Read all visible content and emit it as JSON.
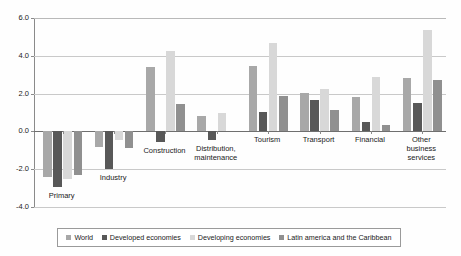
{
  "chart_data": {
    "type": "bar",
    "title": "",
    "subtitle": "",
    "xlabel": "",
    "ylabel": "",
    "ylim": [
      -4.0,
      6.0
    ],
    "yticks": [
      "6.0",
      "4.0",
      "2.0",
      "0.0",
      "-2.0",
      "-4.0"
    ],
    "ytick_values": [
      6.0,
      4.0,
      2.0,
      0.0,
      -2.0,
      -4.0
    ],
    "grid": true,
    "legend_position": "bottom",
    "orientation": "vertical",
    "grouping": "clustered",
    "categories": [
      "Primary",
      "Industry",
      "Construction",
      "Distribution,\nmaintenance",
      "Tourism",
      "Transport",
      "Financial",
      "Other\nbusiness\nservices"
    ],
    "series": [
      {
        "name": "World",
        "color": "#a8a8a8",
        "values": [
          -2.4,
          -0.8,
          3.4,
          0.8,
          3.45,
          2.05,
          1.8,
          2.85
        ]
      },
      {
        "name": "Developed economies",
        "color": "#585858",
        "values": [
          -2.95,
          -2.0,
          -0.55,
          -0.45,
          1.05,
          1.65,
          0.5,
          1.5
        ]
      },
      {
        "name": "Developing economies",
        "color": "#d8d8d8",
        "values": [
          -2.5,
          -0.45,
          4.25,
          1.0,
          4.7,
          2.25,
          2.9,
          5.35
        ]
      },
      {
        "name": "Latin america and the Caribbean",
        "color": "#909090",
        "values": [
          -2.3,
          -0.9,
          1.45,
          0.0,
          1.85,
          1.15,
          0.35,
          2.7
        ]
      }
    ]
  },
  "legend": {
    "items": [
      {
        "label": "World",
        "color": "#a8a8a8"
      },
      {
        "label": "Developed economies",
        "color": "#585858"
      },
      {
        "label": "Developing economies",
        "color": "#d8d8d8"
      },
      {
        "label": "Latin america and the Caribbean",
        "color": "#909090"
      }
    ]
  },
  "colors": {
    "axis": "#8a8a8a",
    "grid": "#c9c9c9",
    "zero_line": "#6f6f6f",
    "text": "#1a1a1a",
    "background": "#ffffff"
  }
}
